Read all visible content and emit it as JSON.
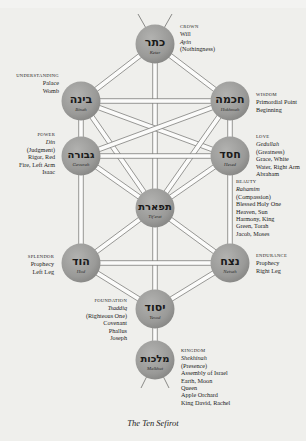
{
  "caption": "The Ten Sefirot",
  "colors": {
    "node_fill": "#9a9a98",
    "path_line": "#6e6e6c",
    "background": "#f3f3f1"
  },
  "sefirot": [
    {
      "id": "keter",
      "hebrew": "כתר",
      "translit": "Keter",
      "side": "right",
      "lines": [
        {
          "t": "CROWN",
          "s": "cap"
        },
        {
          "t": "Will",
          "s": "ln"
        },
        {
          "t": "Ayin",
          "s": "it"
        },
        {
          "t": "(Nothingness)",
          "s": "ln"
        }
      ]
    },
    {
      "id": "binah",
      "hebrew": "בינה",
      "translit": "Binah",
      "side": "left",
      "lines": [
        {
          "t": "UNDERSTANDING",
          "s": "cap"
        },
        {
          "t": "Palace",
          "s": "ln"
        },
        {
          "t": "Womb",
          "s": "ln"
        }
      ]
    },
    {
      "id": "hokhmah",
      "hebrew": "חכמה",
      "translit": "Hokhmah",
      "side": "right",
      "lines": [
        {
          "t": "WISDOM",
          "s": "cap"
        },
        {
          "t": "Primordial Point",
          "s": "ln"
        },
        {
          "t": "Beginning",
          "s": "ln"
        }
      ]
    },
    {
      "id": "gevurah",
      "hebrew": "גבורה",
      "translit": "Gevurah",
      "side": "left",
      "lines": [
        {
          "t": "POWER",
          "s": "cap"
        },
        {
          "t": "Din",
          "s": "it"
        },
        {
          "t": "(Judgment)",
          "s": "ln"
        },
        {
          "t": "Rigor, Red",
          "s": "ln"
        },
        {
          "t": "Fire, Left Arm",
          "s": "ln"
        },
        {
          "t": "Isaac",
          "s": "ln"
        }
      ]
    },
    {
      "id": "hesed",
      "hebrew": "חסד",
      "translit": "Hesed",
      "side": "right",
      "lines": [
        {
          "t": "LOVE",
          "s": "cap"
        },
        {
          "t": "Gedullah",
          "s": "it"
        },
        {
          "t": "(Greatness)",
          "s": "ln"
        },
        {
          "t": "Grace, White",
          "s": "ln"
        },
        {
          "t": "Water, Right Arm",
          "s": "ln"
        },
        {
          "t": "Abraham",
          "s": "ln"
        }
      ]
    },
    {
      "id": "tiferet",
      "hebrew": "תפארת",
      "translit": "Tif'eret",
      "side": "right",
      "lines": [
        {
          "t": "BEAUTY",
          "s": "cap"
        },
        {
          "t": "Rahamim",
          "s": "it"
        },
        {
          "t": "(Compassion)",
          "s": "ln"
        },
        {
          "t": "Blessed Holy One",
          "s": "ln"
        },
        {
          "t": "Heaven, Sun",
          "s": "ln"
        },
        {
          "t": "Harmony, King",
          "s": "ln"
        },
        {
          "t": "Green, Torah",
          "s": "ln"
        },
        {
          "t": "Jacob, Moses",
          "s": "ln"
        }
      ]
    },
    {
      "id": "hod",
      "hebrew": "הוד",
      "translit": "Hod",
      "side": "left",
      "lines": [
        {
          "t": "SPLENDOR",
          "s": "cap"
        },
        {
          "t": "Prophecy",
          "s": "ln"
        },
        {
          "t": "Left Leg",
          "s": "ln"
        }
      ]
    },
    {
      "id": "netsah",
      "hebrew": "נצח",
      "translit": "Netsah",
      "side": "right",
      "lines": [
        {
          "t": "ENDURANCE",
          "s": "cap"
        },
        {
          "t": "Prophecy",
          "s": "ln"
        },
        {
          "t": "Right Leg",
          "s": "ln"
        }
      ]
    },
    {
      "id": "yesod",
      "hebrew": "יסוד",
      "translit": "Yesod",
      "side": "left",
      "lines": [
        {
          "t": "FOUNDATION",
          "s": "cap"
        },
        {
          "t": "Tsaddiq",
          "s": "it"
        },
        {
          "t": "(Righteous One)",
          "s": "ln"
        },
        {
          "t": "Covenant",
          "s": "ln"
        },
        {
          "t": "Phallus",
          "s": "ln"
        },
        {
          "t": "Joseph",
          "s": "ln"
        }
      ]
    },
    {
      "id": "malkhut",
      "hebrew": "מלכות",
      "translit": "Malkhut",
      "side": "right",
      "lines": [
        {
          "t": "KINGDOM",
          "s": "cap"
        },
        {
          "t": "Shekhinah",
          "s": "it"
        },
        {
          "t": "(Presence)",
          "s": "ln"
        },
        {
          "t": "Assembly of Israel",
          "s": "ln"
        },
        {
          "t": "Earth, Moon",
          "s": "ln"
        },
        {
          "t": "Queen",
          "s": "ln"
        },
        {
          "t": "Apple Orchard",
          "s": "ln"
        },
        {
          "t": "King David, Rachel",
          "s": "ln"
        }
      ]
    }
  ],
  "paths": [
    [
      "keter",
      "binah"
    ],
    [
      "keter",
      "hokhmah"
    ],
    [
      "keter",
      "tiferet"
    ],
    [
      "binah",
      "hokhmah"
    ],
    [
      "binah",
      "gevurah"
    ],
    [
      "binah",
      "tiferet"
    ],
    [
      "binah",
      "hesed"
    ],
    [
      "hokhmah",
      "hesed"
    ],
    [
      "hokhmah",
      "tiferet"
    ],
    [
      "hokhmah",
      "gevurah"
    ],
    [
      "gevurah",
      "hesed"
    ],
    [
      "gevurah",
      "tiferet"
    ],
    [
      "gevurah",
      "hod"
    ],
    [
      "hesed",
      "tiferet"
    ],
    [
      "hesed",
      "netsah"
    ],
    [
      "tiferet",
      "hod"
    ],
    [
      "tiferet",
      "netsah"
    ],
    [
      "tiferet",
      "yesod"
    ],
    [
      "hod",
      "netsah"
    ],
    [
      "hod",
      "yesod"
    ],
    [
      "netsah",
      "yesod"
    ],
    [
      "yesod",
      "malkhut"
    ]
  ]
}
